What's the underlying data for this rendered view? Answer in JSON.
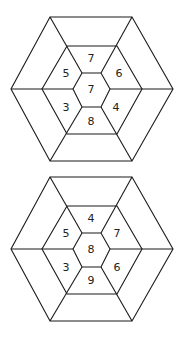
{
  "puzzle": {
    "figures": [
      {
        "name": "hexagon-figure-1",
        "cells": {
          "center": "7",
          "top": "7",
          "upper_left": "5",
          "upper_right": "6",
          "lower_left": "3",
          "lower_right": "4",
          "bottom": "8"
        },
        "outer_ring": [
          "",
          "",
          "",
          "",
          "",
          ""
        ]
      },
      {
        "name": "hexagon-figure-2",
        "cells": {
          "center": "8",
          "top": "4",
          "upper_left": "5",
          "upper_right": "7",
          "lower_left": "3",
          "lower_right": "6",
          "bottom": "9"
        },
        "outer_ring": [
          "",
          "",
          "",
          "",
          "",
          ""
        ]
      }
    ]
  }
}
